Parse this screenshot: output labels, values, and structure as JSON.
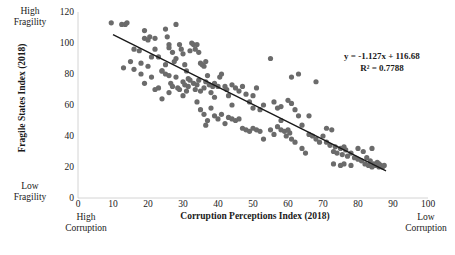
{
  "chart_data": {
    "type": "scatter",
    "title": "",
    "xlabel": "Corruption Perceptions Index (2018)",
    "ylabel": "Fragile States Index (2018)",
    "xlim": [
      0,
      100
    ],
    "ylim": [
      0,
      120
    ],
    "xticks": [
      0,
      10,
      20,
      30,
      40,
      50,
      60,
      70,
      80,
      90,
      100
    ],
    "yticks": [
      0,
      20,
      40,
      60,
      80,
      100,
      120
    ],
    "grid": false,
    "legend": null,
    "annotations": {
      "equation": "y = -1.127x + 116.68",
      "r_squared": "R² = 0.7788",
      "axis_corner_labels": {
        "y_top": "High\nFragility",
        "y_bottom": "Low\nFragility",
        "x_left": "High\nCorruption",
        "x_right": "Low\nCorruption"
      }
    },
    "trendline": {
      "slope": -1.127,
      "intercept": 116.68,
      "x_start": 10,
      "x_end": 88,
      "color": "#1a1a1a"
    },
    "marker": {
      "color": "#6b6b6b",
      "radius": 2.6,
      "shape": "circle"
    },
    "points": [
      [
        9.5,
        113
      ],
      [
        12.5,
        112
      ],
      [
        13.5,
        112
      ],
      [
        14,
        113
      ],
      [
        19,
        108
      ],
      [
        20.5,
        104
      ],
      [
        16,
        96
      ],
      [
        17.5,
        95
      ],
      [
        19,
        103
      ],
      [
        20,
        102
      ],
      [
        22,
        103
      ],
      [
        25,
        109
      ],
      [
        25.5,
        104
      ],
      [
        26,
        99
      ],
      [
        28,
        112
      ],
      [
        13,
        84
      ],
      [
        16,
        83
      ],
      [
        18,
        87
      ],
      [
        19,
        74
      ],
      [
        20,
        85
      ],
      [
        21,
        91
      ],
      [
        22,
        96
      ],
      [
        23,
        91
      ],
      [
        24,
        82
      ],
      [
        25,
        86
      ],
      [
        26,
        97
      ],
      [
        27,
        94
      ],
      [
        27.5,
        88
      ],
      [
        28,
        90
      ],
      [
        29,
        99
      ],
      [
        29.5,
        96
      ],
      [
        30,
        93
      ],
      [
        30.5,
        86
      ],
      [
        31,
        82
      ],
      [
        31.5,
        77
      ],
      [
        32,
        95
      ],
      [
        32.5,
        100
      ],
      [
        33,
        99
      ],
      [
        33.5,
        96
      ],
      [
        34,
        99
      ],
      [
        34.5,
        94
      ],
      [
        35,
        87
      ],
      [
        35.5,
        86
      ],
      [
        36,
        85
      ],
      [
        36.5,
        88
      ],
      [
        22,
        70
      ],
      [
        23,
        71
      ],
      [
        24,
        82
      ],
      [
        25,
        80
      ],
      [
        26,
        79
      ],
      [
        26.5,
        74
      ],
      [
        27,
        72
      ],
      [
        28,
        78
      ],
      [
        28.5,
        71
      ],
      [
        29,
        70
      ],
      [
        30,
        75
      ],
      [
        30.5,
        73
      ],
      [
        31,
        69
      ],
      [
        31.5,
        72
      ],
      [
        32,
        76
      ],
      [
        33,
        74
      ],
      [
        33.5,
        70
      ],
      [
        34,
        73
      ],
      [
        34.5,
        76
      ],
      [
        35,
        69
      ],
      [
        36,
        71
      ],
      [
        36.5,
        75
      ],
      [
        37,
        79
      ],
      [
        37.5,
        73
      ],
      [
        38,
        68
      ],
      [
        38.5,
        72
      ],
      [
        39,
        74
      ],
      [
        40,
        72
      ],
      [
        40.5,
        78
      ],
      [
        41,
        80
      ],
      [
        42,
        72
      ],
      [
        42.5,
        70
      ],
      [
        43,
        66
      ],
      [
        44,
        73
      ],
      [
        45,
        71
      ],
      [
        46,
        69
      ],
      [
        47,
        72
      ],
      [
        48,
        67
      ],
      [
        49,
        62
      ],
      [
        50,
        66
      ],
      [
        51,
        71
      ],
      [
        52,
        57
      ],
      [
        53,
        60
      ],
      [
        55,
        90
      ],
      [
        56,
        62
      ],
      [
        57,
        58
      ],
      [
        58,
        59
      ],
      [
        60,
        63
      ],
      [
        61,
        61
      ],
      [
        62,
        57
      ],
      [
        63,
        53
      ],
      [
        64,
        47
      ],
      [
        61,
        78
      ],
      [
        68,
        75
      ],
      [
        63,
        80
      ],
      [
        34,
        62
      ],
      [
        35,
        57
      ],
      [
        36,
        54
      ],
      [
        36.5,
        47
      ],
      [
        37,
        50
      ],
      [
        38,
        58
      ],
      [
        39,
        53
      ],
      [
        40,
        51
      ],
      [
        41,
        54
      ],
      [
        42,
        48
      ],
      [
        43,
        52
      ],
      [
        44,
        51
      ],
      [
        45,
        50
      ],
      [
        46,
        51
      ],
      [
        47,
        45
      ],
      [
        48,
        44
      ],
      [
        49,
        43
      ],
      [
        50,
        45
      ],
      [
        51,
        44
      ],
      [
        52,
        43
      ],
      [
        53,
        38
      ],
      [
        55,
        44
      ],
      [
        56,
        41
      ],
      [
        57,
        46
      ],
      [
        58,
        44
      ],
      [
        59,
        43
      ],
      [
        59.5,
        40
      ],
      [
        60,
        44
      ],
      [
        60.5,
        42
      ],
      [
        61,
        38
      ],
      [
        62,
        36
      ],
      [
        64,
        32
      ],
      [
        65,
        29
      ],
      [
        66,
        41
      ],
      [
        67,
        40
      ],
      [
        68,
        38
      ],
      [
        69,
        36
      ],
      [
        70,
        40
      ],
      [
        71,
        36
      ],
      [
        72,
        34
      ],
      [
        72.5,
        44
      ],
      [
        73,
        30
      ],
      [
        73.5,
        33
      ],
      [
        74,
        29
      ],
      [
        75,
        32
      ],
      [
        75.5,
        28
      ],
      [
        76,
        33
      ],
      [
        76.5,
        31
      ],
      [
        77,
        27
      ],
      [
        78,
        29
      ],
      [
        79,
        26
      ],
      [
        80,
        25
      ],
      [
        81,
        24
      ],
      [
        81.5,
        30
      ],
      [
        82,
        22
      ],
      [
        82.5,
        26
      ],
      [
        83,
        21
      ],
      [
        83.5,
        24
      ],
      [
        84,
        20
      ],
      [
        84.5,
        22
      ],
      [
        85,
        21
      ],
      [
        85.5,
        23
      ],
      [
        86,
        20
      ],
      [
        86.5,
        21
      ],
      [
        87,
        20
      ],
      [
        87.5,
        21
      ],
      [
        73,
        22
      ],
      [
        75,
        21
      ],
      [
        76,
        22
      ],
      [
        78,
        21
      ],
      [
        80,
        32
      ],
      [
        84,
        32
      ],
      [
        86,
        22
      ],
      [
        71,
        45
      ],
      [
        66,
        53
      ],
      [
        58,
        50
      ],
      [
        50,
        58
      ],
      [
        44,
        60
      ],
      [
        39,
        65
      ],
      [
        30,
        66
      ],
      [
        26,
        68
      ],
      [
        24,
        64
      ],
      [
        21,
        78
      ],
      [
        18,
        80
      ],
      [
        15,
        88
      ]
    ]
  }
}
